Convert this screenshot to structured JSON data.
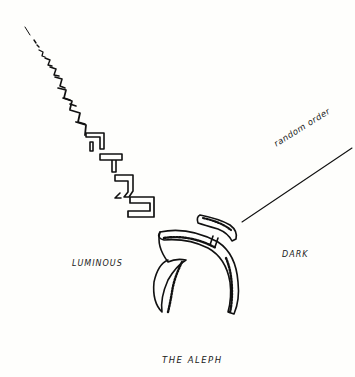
{
  "figure": {
    "caption": "THE ALEPH",
    "labels": {
      "left": "LUMINOUS",
      "right": "DARK",
      "diagonal": "random order"
    },
    "central_glyph": "aleph",
    "letter_chain": [
      "bet",
      "gimel",
      "dalet",
      "he",
      "vav",
      "zayin",
      "chet",
      "tet",
      "yod"
    ],
    "ink_color": "#111111",
    "paper_color": "#fefefc"
  }
}
